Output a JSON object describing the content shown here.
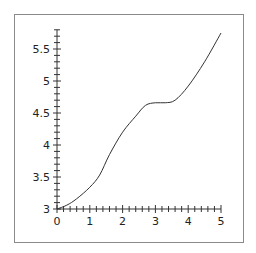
{
  "chart_data": {
    "type": "line",
    "title": "",
    "xlabel": "",
    "ylabel": "",
    "xlim": [
      0,
      5
    ],
    "ylim": [
      3,
      5.75
    ],
    "grid": false,
    "legend": null,
    "x_ticks": [
      "0",
      "1",
      "2",
      "3",
      "4",
      "5"
    ],
    "y_ticks": [
      "3",
      "3.5",
      "4",
      "4.5",
      "5",
      "5.5"
    ],
    "series": [
      {
        "name": "curve",
        "color": "#333333",
        "x": [
          0,
          0.3,
          0.6,
          1.0,
          1.3,
          1.6,
          2.0,
          2.4,
          2.7,
          3.0,
          3.3,
          3.6,
          4.0,
          4.5,
          5.0
        ],
        "y": [
          3.0,
          3.06,
          3.16,
          3.34,
          3.53,
          3.85,
          4.2,
          4.45,
          4.62,
          4.66,
          4.66,
          4.7,
          4.92,
          5.3,
          5.75
        ]
      }
    ]
  }
}
